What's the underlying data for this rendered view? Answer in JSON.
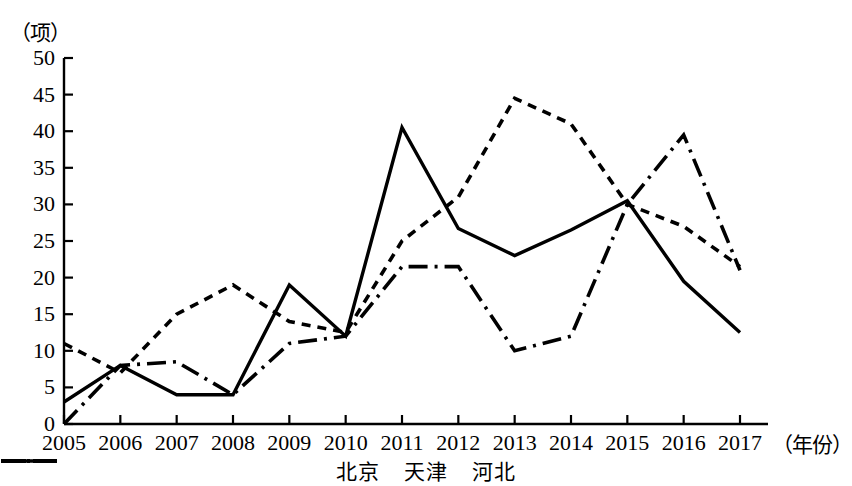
{
  "chart_data": {
    "type": "line",
    "title": "",
    "ylabel": "（项）",
    "xlabel": "（年份）",
    "categories": [
      "2005",
      "2006",
      "2007",
      "2008",
      "2009",
      "2010",
      "2011",
      "2012",
      "2013",
      "2014",
      "2015",
      "2016",
      "2017"
    ],
    "ylim": [
      0,
      50
    ],
    "ytick_labels": [
      "0",
      "5",
      "10",
      "15",
      "20",
      "25",
      "30",
      "35",
      "40",
      "45",
      "50"
    ],
    "ytick_values": [
      0,
      5,
      10,
      15,
      20,
      25,
      30,
      35,
      40,
      45,
      50
    ],
    "grid": false,
    "legend_position": "bottom",
    "series": [
      {
        "name": "北京",
        "style": "solid",
        "color": "#000000",
        "values": [
          3,
          8,
          4,
          4,
          19,
          12,
          40.5,
          26.7,
          23,
          26.5,
          30.5,
          19.5,
          12.5
        ]
      },
      {
        "name": "天津",
        "style": "dotted",
        "color": "#000000",
        "values": [
          11,
          7,
          15,
          19,
          14,
          12.5,
          25,
          31,
          44.5,
          41,
          30,
          27,
          21.5
        ]
      },
      {
        "name": "河北",
        "style": "dashdot",
        "color": "#000000",
        "values": [
          0,
          8,
          8.5,
          4,
          11,
          12,
          21.5,
          21.5,
          10,
          12,
          30,
          39.5,
          21
        ]
      }
    ]
  },
  "axis": {
    "y_unit": "（项）",
    "x_unit": "（年份）"
  }
}
